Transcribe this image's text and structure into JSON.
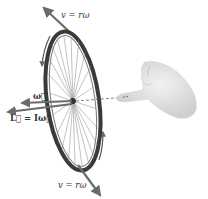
{
  "figure": {
    "labels": {
      "v_top": "v = rω",
      "v_bottom": "v = rω",
      "omega": "ω⃗",
      "angular_momentum": "L⃗ = Iω⃗"
    },
    "colors": {
      "arrow": "#6b6b6b",
      "tire": "#3a3a3a",
      "spokes": "#8a8a8a",
      "hand": "#e6e6e6",
      "hand_shadow": "#c8c8c8",
      "text": "#333333"
    }
  }
}
